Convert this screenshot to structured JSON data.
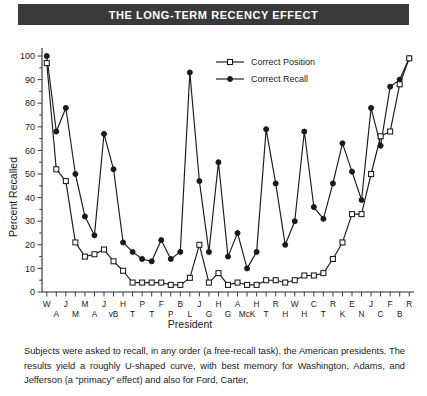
{
  "title": {
    "text": "THE LONG-TERM RECENCY EFFECT"
  },
  "caption": {
    "text": "Subjects were asked to recall, in any order (a free-recall task), the American presidents. The results yield a roughly U-shaped curve, with best memory for Washington, Adams, and Jefferson (a “primacy” effect) and also for Ford, Carter,"
  },
  "legend": {
    "position": "top-center",
    "items": [
      {
        "label": "Correct Position",
        "marker": "open-square"
      },
      {
        "label": "Correct Recall",
        "marker": "filled-circle"
      }
    ]
  },
  "chart_data": {
    "type": "line",
    "title": "THE LONG-TERM RECENCY EFFECT",
    "xlabel": "President",
    "ylabel": "Percent Recalled",
    "ylim": [
      0,
      100
    ],
    "yticks": [
      0,
      10,
      20,
      30,
      40,
      50,
      60,
      70,
      80,
      90,
      100
    ],
    "grid": false,
    "legend_position": "top-center",
    "categories": [
      "W",
      "A",
      "J",
      "M",
      "M",
      "A",
      "J",
      "vB",
      "H",
      "T",
      "P",
      "T",
      "F",
      "P",
      "B",
      "L",
      "J",
      "G",
      "H",
      "G",
      "A",
      "H",
      "McK",
      "R",
      "T",
      "W",
      "H",
      "C",
      "H",
      "R",
      "T",
      "E",
      "K",
      "J",
      "N",
      "F",
      "C",
      "R",
      "B"
    ],
    "tick_labels_top_row": [
      "W",
      "",
      "J",
      "",
      "M",
      "",
      "J",
      "",
      "H",
      "",
      "P",
      "",
      "F",
      "",
      "B",
      "",
      "J",
      "",
      "H",
      "",
      "A",
      "",
      "H",
      "",
      "R",
      "",
      "W",
      "",
      "C",
      "",
      "R",
      "",
      "E",
      "",
      "J",
      "",
      "F",
      "",
      "R"
    ],
    "tick_labels_bottom_row": [
      "",
      "A",
      "",
      "M",
      "",
      "A",
      "",
      "vB",
      "",
      "T",
      "",
      "T",
      "",
      "P",
      "",
      "L",
      "",
      "G",
      "",
      "G",
      "",
      "McK",
      "",
      "T",
      "",
      "H",
      "",
      "H",
      "",
      "T",
      "",
      "K",
      "",
      "N",
      "",
      "C",
      "",
      "B",
      ""
    ],
    "series": [
      {
        "name": "Correct Recall",
        "marker": "filled-circle",
        "values": [
          100,
          68,
          78,
          50,
          32,
          24,
          67,
          52,
          21,
          17,
          14,
          13,
          22,
          14,
          17,
          93,
          47,
          17,
          55,
          15,
          25,
          10,
          17,
          69,
          46,
          20,
          30,
          68,
          36,
          31,
          46,
          63,
          51,
          39,
          78,
          62,
          87,
          90,
          99
        ]
      },
      {
        "name": "Correct Position",
        "marker": "open-square",
        "values": [
          97,
          52,
          47,
          21,
          15,
          16,
          18,
          13,
          9,
          4,
          4,
          4,
          4,
          3,
          3,
          6,
          20,
          4,
          8,
          3,
          4,
          3,
          3,
          5,
          5,
          4,
          5,
          7,
          7,
          8,
          14,
          21,
          33,
          33,
          50,
          66,
          68,
          88,
          99
        ]
      }
    ]
  },
  "icons": {
    "open_square_marker": "open-square-marker-icon",
    "filled_circle_marker": "filled-circle-marker-icon"
  }
}
